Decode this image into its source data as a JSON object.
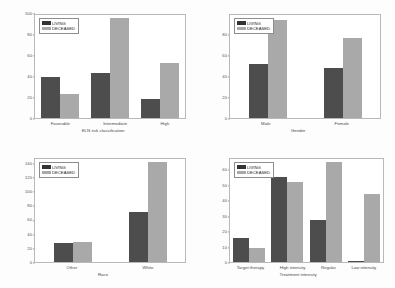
{
  "legend": {
    "living_label": "LIVING",
    "deceased_label": "DECEASED"
  },
  "colors": {
    "living": "#4d4d4d",
    "deceased": "#a9a9a9",
    "frame": "#b9b9b9",
    "background": "#fdfdfd"
  },
  "chart_data": [
    {
      "type": "bar",
      "title": "",
      "xlabel": "ELN risk classification",
      "ylabel": "",
      "categories": [
        "Favorable",
        "Intermediate",
        "High"
      ],
      "series": [
        {
          "name": "LIVING",
          "values": [
            40,
            44,
            18
          ]
        },
        {
          "name": "DECEASED",
          "values": [
            23,
            97,
            53
          ]
        }
      ],
      "yticks": [
        0,
        20,
        40,
        60,
        80,
        100
      ],
      "ylim": [
        0,
        100
      ],
      "grid": false,
      "legend_position": "top-left"
    },
    {
      "type": "bar",
      "title": "",
      "xlabel": "Gender",
      "ylabel": "",
      "categories": [
        "Male",
        "Female"
      ],
      "series": [
        {
          "name": "LIVING",
          "values": [
            52,
            49
          ]
        },
        {
          "name": "DECEASED",
          "values": [
            95,
            78
          ]
        }
      ],
      "yticks": [
        0,
        20,
        40,
        60,
        80
      ],
      "ylim": [
        0,
        100
      ],
      "grid": false,
      "legend_position": "top-left"
    },
    {
      "type": "bar",
      "title": "",
      "xlabel": "Race",
      "ylabel": "",
      "categories": [
        "Other",
        "White"
      ],
      "series": [
        {
          "name": "LIVING",
          "values": [
            27,
            72
          ]
        },
        {
          "name": "DECEASED",
          "values": [
            29,
            143
          ]
        }
      ],
      "yticks": [
        0,
        20,
        40,
        60,
        80,
        100,
        120,
        140
      ],
      "ylim": [
        0,
        148
      ],
      "grid": false,
      "legend_position": "top-left"
    },
    {
      "type": "bar",
      "title": "",
      "xlabel": "Treatment intensity",
      "ylabel": "",
      "categories": [
        "Target therapy",
        "High intensity",
        "Regular",
        "Low intensity"
      ],
      "series": [
        {
          "name": "LIVING",
          "values": [
            16,
            56,
            28,
            1
          ]
        },
        {
          "name": "DECEASED",
          "values": [
            9,
            53,
            66,
            45
          ]
        }
      ],
      "yticks": [
        0,
        10,
        20,
        30,
        40,
        50,
        60
      ],
      "ylim": [
        0,
        68
      ],
      "grid": false,
      "legend_position": "top-left"
    }
  ]
}
